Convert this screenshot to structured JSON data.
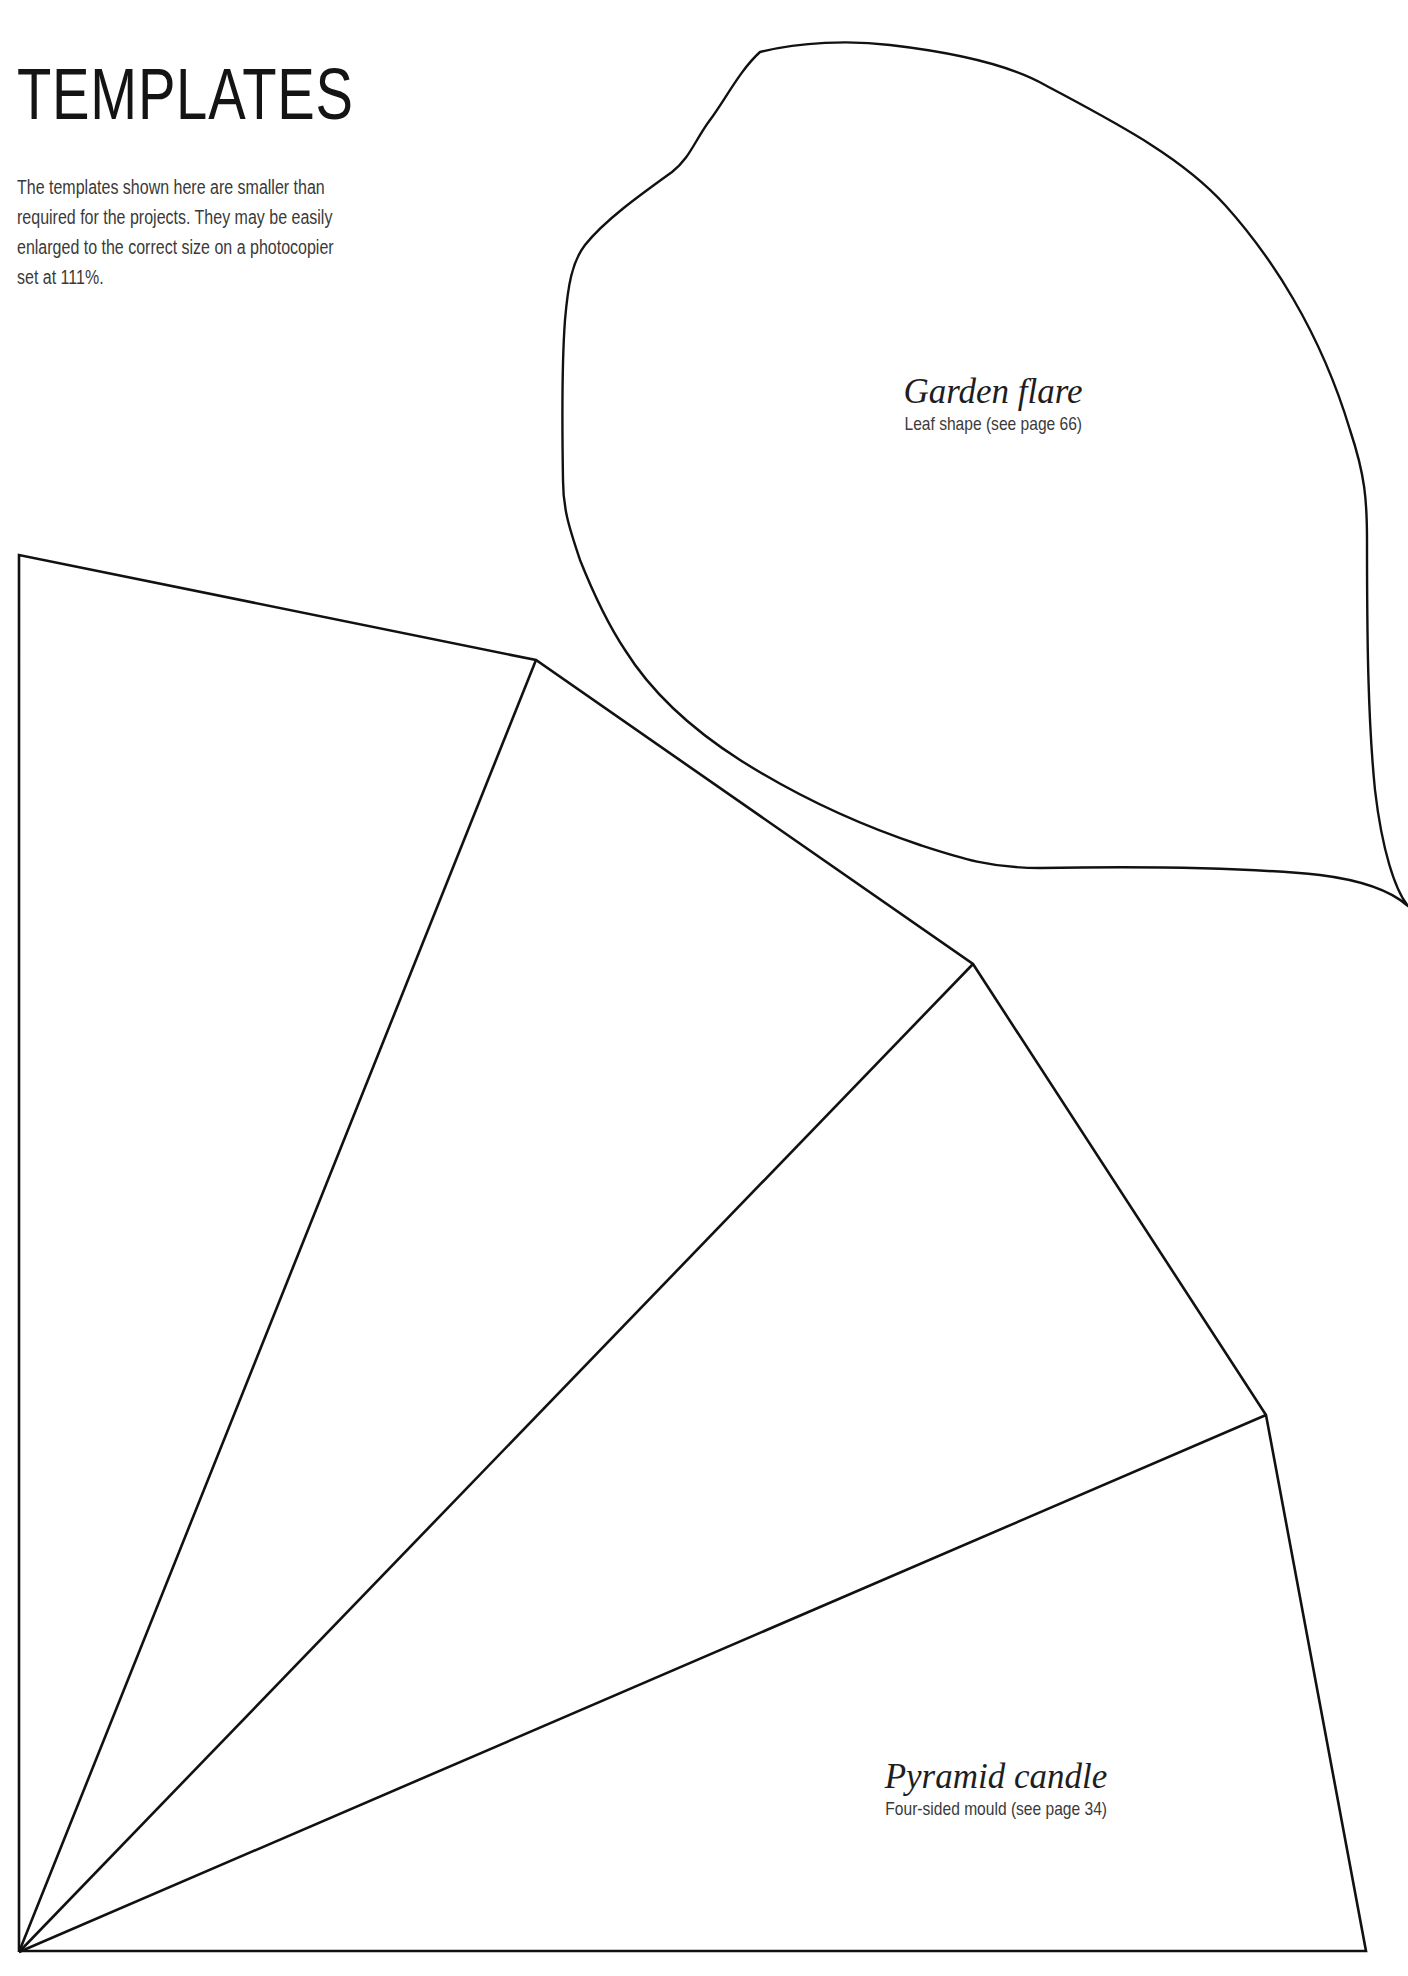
{
  "page": {
    "title": "TEMPLATES",
    "intro_lines": [
      "The templates shown here are smaller than",
      "required for the projects. They may be easily",
      "enlarged to the correct size on a photocopier",
      "set at 111%."
    ]
  },
  "templates": [
    {
      "id": "garden-flare",
      "name": "Garden flare",
      "caption": "Leaf shape (see page 66)"
    },
    {
      "id": "pyramid-candle",
      "name": "Pyramid candle",
      "caption": "Four-sided mould (see page 34)"
    }
  ],
  "colors": {
    "background": "#ffffff",
    "outline": "#111111",
    "heading": "#141414",
    "body_text": "#3a3a3a"
  }
}
